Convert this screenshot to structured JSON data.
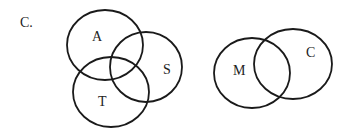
{
  "option_label": "C.",
  "diagram_left": {
    "circles": [
      {
        "id": "A",
        "label": "A",
        "cx": 105,
        "cy": 45,
        "rx": 38,
        "ry": 35,
        "label_x": 97,
        "label_y": 41
      },
      {
        "id": "S",
        "label": "S",
        "cx": 146,
        "cy": 67,
        "rx": 36,
        "ry": 35,
        "label_x": 165,
        "label_y": 74
      },
      {
        "id": "T",
        "label": "T",
        "cx": 111,
        "cy": 92,
        "rx": 38,
        "ry": 35,
        "label_x": 98,
        "label_y": 106
      }
    ]
  },
  "diagram_right": {
    "circles": [
      {
        "id": "M",
        "label": "M",
        "cx": 252,
        "cy": 73,
        "rx": 38,
        "ry": 35,
        "label_x": 234,
        "label_y": 74
      },
      {
        "id": "C",
        "label": "C",
        "cx": 293,
        "cy": 64,
        "rx": 39,
        "ry": 35,
        "label_x": 306,
        "label_y": 57
      }
    ]
  },
  "colors": {
    "stroke": "#1a1a1a",
    "text": "#222222",
    "background": "#ffffff"
  }
}
